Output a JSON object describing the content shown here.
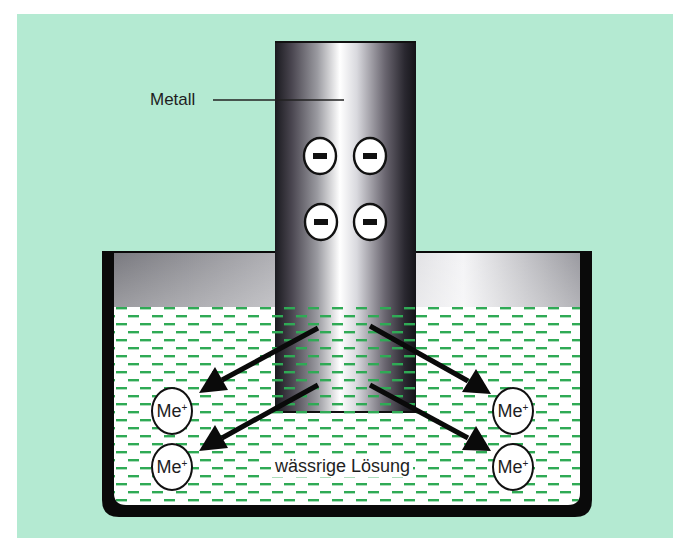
{
  "diagram": {
    "labels": {
      "metal": "Metall",
      "solution": "wässrige Lösung"
    },
    "electrons": {
      "symbol": "−",
      "count": 4
    },
    "ions": [
      {
        "id": "ion-left-top",
        "base": "Me",
        "charge": "+"
      },
      {
        "id": "ion-left-bottom",
        "base": "Me",
        "charge": "+"
      },
      {
        "id": "ion-right-top",
        "base": "Me",
        "charge": "+"
      },
      {
        "id": "ion-right-bottom",
        "base": "Me",
        "charge": "+"
      }
    ],
    "arrows": 4,
    "colors": {
      "background": "#b4ead2",
      "liquid_dash": "#2faa55",
      "liquid": "#ffffff",
      "outline": "#0a0a0a",
      "rod_dark": "#222222",
      "rod_highlight": "#ffffff"
    }
  }
}
